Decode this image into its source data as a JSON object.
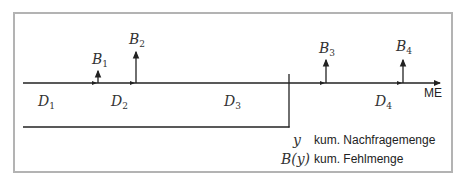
{
  "diagram": {
    "axis_label": "ME",
    "backorders": [
      {
        "symbol": "B",
        "index": "1",
        "x": 98,
        "top": 70
      },
      {
        "symbol": "B",
        "index": "2",
        "x": 136,
        "top": 51
      },
      {
        "symbol": "B",
        "index": "3",
        "x": 326,
        "top": 59
      },
      {
        "symbol": "B",
        "index": "4",
        "x": 403,
        "top": 59
      }
    ],
    "demands": [
      {
        "symbol": "D",
        "index": "1",
        "x": 45
      },
      {
        "symbol": "D",
        "index": "2",
        "x": 119
      },
      {
        "symbol": "D",
        "index": "3",
        "x": 232
      },
      {
        "symbol": "D",
        "index": "4",
        "x": 380
      }
    ],
    "legend": [
      {
        "symbol": "y",
        "text": "kum. Nachfragemenge"
      },
      {
        "symbol": "B(y)",
        "text": "kum. Fehlmenge"
      }
    ],
    "colors": {
      "line": "#222222",
      "border": "#b3b3b3",
      "text": "#333333"
    }
  }
}
